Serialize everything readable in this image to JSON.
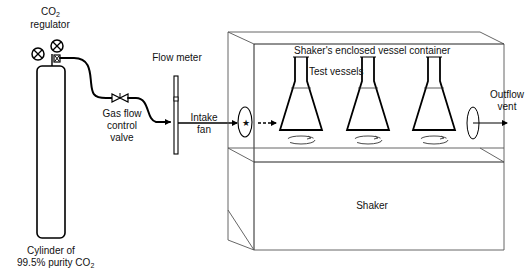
{
  "diagram": {
    "type": "apparatus-schematic",
    "labels": {
      "regulator_line1_main": "CO",
      "regulator_line1_sub": "2",
      "regulator_line2": "regulator",
      "cylinder_line1": "Cylinder of",
      "cylinder_line2_main": "99.5% purity CO",
      "cylinder_line2_sub": "2",
      "valve_line1": "Gas flow",
      "valve_line2": "control",
      "valve_line3": "valve",
      "flow_meter": "Flow meter",
      "intake_line1": "Intake",
      "intake_line2": "fan",
      "enclosure": "Shaker's enclosed vessel  container",
      "test_vessels": "Test vessels",
      "outflow_line1": "Outflow",
      "outflow_line2": "vent",
      "shaker": "Shaker"
    },
    "components": [
      {
        "id": "cylinder",
        "name": "Cylinder of 99.5% purity CO2"
      },
      {
        "id": "regulator",
        "name": "CO2 regulator",
        "gauges": 2
      },
      {
        "id": "valve",
        "name": "Gas flow control valve"
      },
      {
        "id": "flow-meter",
        "name": "Flow meter"
      },
      {
        "id": "intake-fan",
        "name": "Intake fan"
      },
      {
        "id": "enclosure",
        "name": "Shaker's enclosed vessel container"
      },
      {
        "id": "test-vessels",
        "name": "Test vessels",
        "count": 3
      },
      {
        "id": "outflow-vent",
        "name": "Outflow vent"
      },
      {
        "id": "shaker",
        "name": "Shaker"
      }
    ],
    "flow": [
      "cylinder",
      "regulator",
      "valve",
      "flow-meter",
      "intake-fan",
      "enclosure",
      "outflow-vent"
    ],
    "colors": {
      "line": "#000000",
      "box": "#222222",
      "background": "#ffffff"
    }
  }
}
